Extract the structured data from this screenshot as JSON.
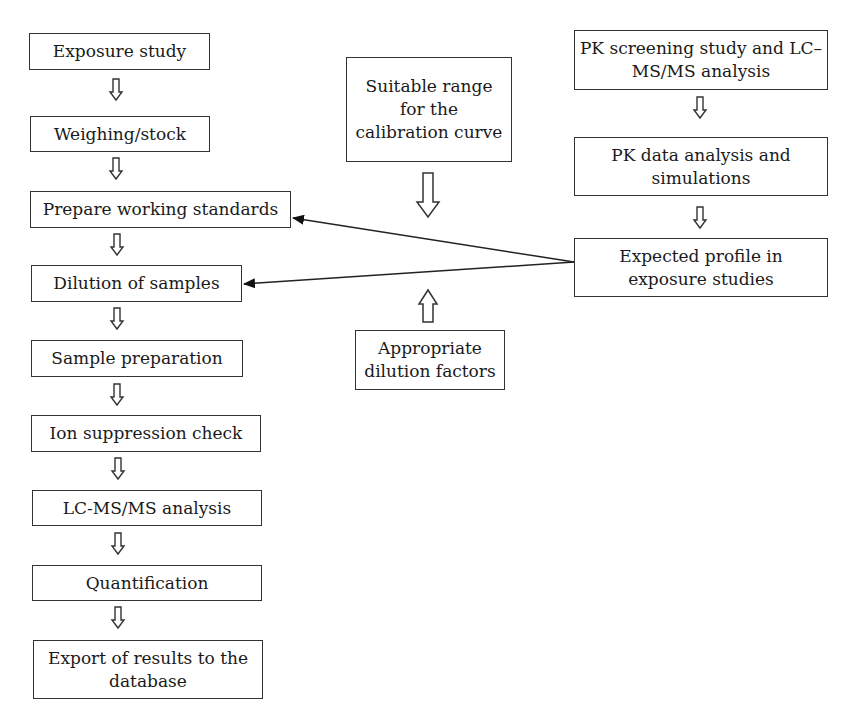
{
  "left_column": {
    "steps": [
      {
        "label": "Exposure study"
      },
      {
        "label": "Weighing/stock"
      },
      {
        "label": "Prepare working standards"
      },
      {
        "label": "Dilution of samples"
      },
      {
        "label": "Sample preparation"
      },
      {
        "label": "Ion suppression check"
      },
      {
        "label": "LC-MS/MS analysis"
      },
      {
        "label": "Quantification"
      },
      {
        "label": "Export of results to the database"
      }
    ]
  },
  "middle_column": {
    "calibration_range": "Suitable range for the calibration curve",
    "dilution_factors": "Appropriate dilution factors"
  },
  "right_column": {
    "steps": [
      {
        "label": "PK screening study and LC–MS/MS analysis"
      },
      {
        "label": "PK data analysis and simulations"
      },
      {
        "label": "Expected profile in exposure studies"
      }
    ]
  },
  "connections": [
    {
      "from": "Expected profile in exposure studies",
      "to": "Prepare working standards"
    },
    {
      "from": "Expected profile in exposure studies",
      "to": "Dilution of samples"
    }
  ],
  "colors": {
    "stroke": "#333333",
    "background": "#ffffff",
    "text": "#1a1a1a"
  }
}
